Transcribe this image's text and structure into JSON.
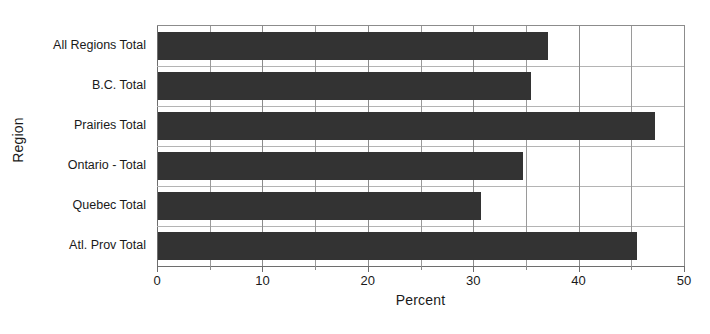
{
  "chart_data": {
    "type": "bar",
    "orientation": "horizontal",
    "title": "",
    "xlabel": "Percent",
    "ylabel": "Region",
    "xlim": [
      0,
      50
    ],
    "xticks": [
      0,
      10,
      20,
      30,
      40,
      50
    ],
    "xtick_labels": [
      "0",
      "10",
      "20",
      "30",
      "40",
      "50"
    ],
    "minor_xticks": [
      5,
      15,
      25,
      35,
      45
    ],
    "grid": true,
    "legend": null,
    "bar_color": "#333333",
    "gridline_color": "#8c8c8c",
    "background_color": "#ffffff",
    "categories": [
      "All Regions Total",
      "B.C. Total",
      "Prairies Total",
      "Ontario - Total",
      "Quebec Total",
      "Atl. Prov Total"
    ],
    "values": [
      37.0,
      35.4,
      47.2,
      34.6,
      30.6,
      45.4
    ],
    "bars": [
      {
        "category": "All Regions Total",
        "value": 37.0
      },
      {
        "category": "B.C. Total",
        "value": 35.4
      },
      {
        "category": "Prairies Total",
        "value": 47.2
      },
      {
        "category": "Ontario - Total",
        "value": 34.6
      },
      {
        "category": "Quebec Total",
        "value": 30.6
      },
      {
        "category": "Atl. Prov Total",
        "value": 45.4
      }
    ]
  }
}
